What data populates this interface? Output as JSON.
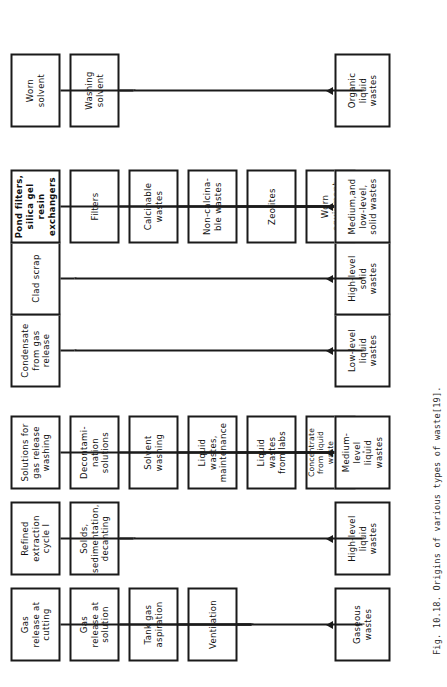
{
  "figure": {
    "caption": "Fig. 10.18. Origins of various types of waste[19].",
    "orientation": "rotated-90-ccw"
  },
  "colors": {
    "box_border": "#1a1a1a",
    "box_fill": "#ffffff",
    "text": "#111111",
    "page_background": "#ffffff",
    "caption_text": "#2b2b2b"
  },
  "groups": [
    {
      "id": "gaseous",
      "sink": "Gaseous\nwastes",
      "sources": [
        "Gas\nrelease at\ncutting",
        "Gas\nrelease at\nsolution",
        "Tank gas\naspiration",
        "Ventilation"
      ]
    },
    {
      "id": "high-level-liquid",
      "sink": "High-level\nliquid\nwastes",
      "sources": [
        "Refined\nextraction\ncycle I",
        "Solids,\nsedimentation,\ndecanting"
      ]
    },
    {
      "id": "medium-level-liquid",
      "sink": "Medium-\nlevel\nliquid\nwastes",
      "sources": [
        "Solutions for\ngas release\nwashing",
        "Decontami-\nnation\nsolutions",
        "Solvent\nwashing",
        "Liquid\nwastes,\nmaintenance",
        "Liquid\nwastes\nfrom labs",
        "Concentrate\nfrom liquid\nwaste\nevaporation\nand others"
      ]
    },
    {
      "id": "low-level-liquid",
      "sink": "Low-level\nliquid\nwastes",
      "sources": [
        "Condensate\nfrom gas\nrelease"
      ]
    },
    {
      "id": "high-level-solid",
      "sink": "High-level\nsolid\nwastes",
      "sources": [
        "Clad scrap"
      ]
    },
    {
      "id": "medium-and-low-level-solid",
      "sink": "Medium,and\nlow-level,\nsolid wastes",
      "sources": [
        "Pond filters,\nsilica gel\nresin\nexchangers",
        "Filters",
        "Calcinable\nwastes",
        "Non-calcina-\nble wastes",
        "Zeolites",
        "Worn\nequipment"
      ]
    },
    {
      "id": "organic-liquid",
      "sink": "Organic\nliquid\nwastes",
      "sources": [
        "Worn\nsolvent",
        "Washing\nsolvent"
      ]
    }
  ]
}
